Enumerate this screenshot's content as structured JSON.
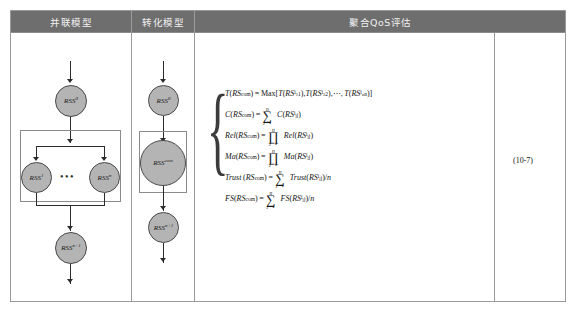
{
  "figure": {
    "equation_number": "(10-7)"
  },
  "table": {
    "headers": [
      {
        "label": "并联模型",
        "name": "header-parallel-model"
      },
      {
        "label": "转化模型",
        "name": "header-transform-model"
      },
      {
        "label": "聚合QoS评估",
        "name": "header-aggregate-qos"
      }
    ],
    "header_bg": "#6e6e6e",
    "header_text_color": "#f2f2f2",
    "border_color": "#9a9a9a"
  },
  "parallel_model": {
    "nodes": [
      {
        "id": "top",
        "base": "RSS",
        "sup": "0"
      },
      {
        "id": "left",
        "base": "RSS",
        "sup": "1"
      },
      {
        "id": "right",
        "base": "RSS",
        "sup": "n"
      },
      {
        "id": "bottom",
        "base": "RSS",
        "sup": "n+1"
      }
    ],
    "ellipsis": "•••",
    "node_fill": "#b4b4b4",
    "node_stroke": "#4a4a4a"
  },
  "transform_model": {
    "nodes": [
      {
        "id": "top",
        "base": "RSS",
        "sup": "0"
      },
      {
        "id": "mid",
        "base": "RSS",
        "sup": "com"
      },
      {
        "id": "bottom",
        "base": "RSS",
        "sup": "n+1"
      }
    ],
    "node_fill": "#b4b4b4",
    "node_stroke": "#4a4a4a"
  },
  "equations": [
    {
      "name": "equation-time",
      "parts": {
        "lhs_fn": "T",
        "lhs_arg": "RS",
        "lhs_sup": "com",
        "rel": "=",
        "op": "Max[",
        "terms": "T(RS",
        "t1_sub": "i1",
        "t1_sup": "1",
        "t2_sub": "i2",
        "t2_sup": "2",
        "tn_sub": "in",
        "tn_sup": "n",
        "tail": ")]"
      },
      "text": "T(RS^com) = Max[T(RS_i1^1), T(RS_i2^2), ···, T(RS_in^n)]"
    },
    {
      "name": "equation-cost",
      "text": "C(RS^com) = ∑_{j=1}^{n} C(RS_ij^j)"
    },
    {
      "name": "equation-reliability",
      "text": "Rel(RS^com) = ∏_{j=1}^{n} Rel(RS_ij^j)"
    },
    {
      "name": "equation-availability",
      "text": "Ma(RS^com) = ∏_{j=1}^{n} Ma(RS_ij^j)"
    },
    {
      "name": "equation-trust",
      "text": "Trust(RS^com) = ∑_{j=1}^{n} Trust(RS_ij^j)/n"
    },
    {
      "name": "equation-fs",
      "text": "FS(RS^com) = ∑_{j=1}^{n} FS(RS_ij^j)/n"
    }
  ],
  "symbols": {
    "sum": "∑",
    "prod": "∏",
    "cdots": "⋯",
    "equals": "=",
    "slash_n": "/n"
  }
}
